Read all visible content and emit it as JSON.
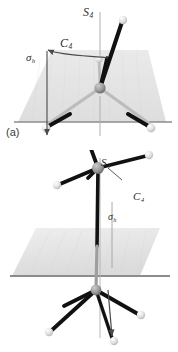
{
  "figure": {
    "width": 178,
    "height": 352,
    "background": "#ffffff"
  },
  "colors": {
    "bond": "#111111",
    "atom_light": "#e6e6e6",
    "atom_center": "#9a9a9a",
    "plane_fill": "#e4e4e4",
    "plane_edge": "#8c8c8c",
    "axis_line": "#a8a8a8",
    "label_text": "#2e2e2e",
    "panel_label_text": "#3a3a3a",
    "arrow": "#4a4a4a"
  },
  "panels": [
    {
      "id": "a",
      "label": "(a)",
      "caption_position": "bottom-left",
      "plane_type": "vertical-trapezoid",
      "plane_orientation": "perpendicular to page, seen edge-on as horizontal line",
      "labels": [
        {
          "name": "s4-axis-label",
          "symbol": "S",
          "subscript": "4",
          "text": "S4"
        },
        {
          "name": "c4-rotation-label",
          "symbol": "C",
          "subscript": "4",
          "text": "C4"
        },
        {
          "name": "sigma-h-label",
          "symbol": "σ",
          "subscript": "h",
          "text": "σh"
        }
      ],
      "molecule": {
        "type": "tetrahedral-ball-and-stick",
        "central_atom_position": [
          100,
          88
        ],
        "ligand_count": 4,
        "ligands": [
          {
            "position": [
              124,
              20
            ],
            "direction": "up-right"
          },
          {
            "position": [
              98,
              65
            ],
            "direction": "up"
          },
          {
            "position": [
              47,
              126
            ],
            "direction": "down-left"
          },
          {
            "position": [
              148,
              126
            ],
            "direction": "down-right"
          }
        ]
      },
      "annotations": [
        {
          "name": "c4-curved-arrow",
          "type": "curved-arrow",
          "meaning": "rotation by 90 degrees about vertical axis"
        },
        {
          "name": "sigma-h-down-arrow",
          "type": "straight-arrow",
          "meaning": "reflection through horizontal plane"
        },
        {
          "name": "s4-vertical-axis",
          "type": "axis-line",
          "meaning": "improper rotation axis"
        }
      ]
    },
    {
      "id": "b",
      "label": "(b)",
      "caption_position": "bottom-left",
      "plane_type": "horizontal-parallelogram",
      "plane_orientation": "horizontal mirror plane drawn in perspective",
      "labels": [
        {
          "name": "s4-axis-label",
          "symbol": "S",
          "subscript": "4",
          "text": "S4"
        },
        {
          "name": "c4-rotation-label",
          "symbol": "C",
          "subscript": "4",
          "text": "C4"
        },
        {
          "name": "sigma-h-label",
          "symbol": "σ",
          "subscript": "h",
          "text": "σh"
        }
      ],
      "molecule": {
        "type": "two-center-ball-and-stick",
        "upper_center_position": [
          98,
          168
        ],
        "lower_center_position": [
          96,
          290
        ],
        "upper_ligand_count": 4,
        "lower_ligand_count": 4,
        "upper_ligands": [
          {
            "position": [
              88,
              60
            ],
            "direction": "up"
          },
          {
            "position": [
              56,
              110
            ],
            "direction": "left"
          },
          {
            "position": [
              150,
              104
            ],
            "direction": "up-right"
          },
          {
            "position": [
              96,
              290
            ],
            "direction": "down-vertical"
          }
        ],
        "lower_ligands": [
          {
            "position": [
              52,
              330
            ],
            "direction": "down-left"
          },
          {
            "position": [
              138,
              314
            ],
            "direction": "right"
          },
          {
            "position": [
              112,
              338
            ],
            "direction": "down-right"
          }
        ]
      },
      "annotations": [
        {
          "name": "c4-arrow",
          "type": "straight-arrow",
          "meaning": "rotation about vertical axis"
        },
        {
          "name": "sigma-h-bracket",
          "type": "vertical-line",
          "meaning": "reflection distance through horizontal mirror plane"
        },
        {
          "name": "s4-vertical-axis",
          "type": "axis-line",
          "meaning": "improper rotation axis"
        },
        {
          "name": "reflection-down-arrow",
          "type": "straight-arrow",
          "meaning": "reflected ligand direction"
        }
      ]
    }
  ]
}
